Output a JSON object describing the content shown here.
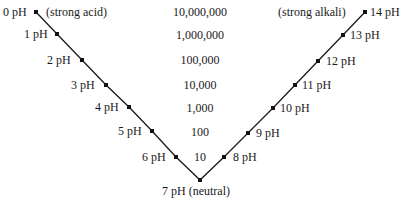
{
  "left_labels": [
    {
      "text": "0 pH",
      "x": 3,
      "y": 5
    },
    {
      "text": "1 pH",
      "x": 24,
      "y": 27
    },
    {
      "text": "2 pH",
      "x": 47,
      "y": 53
    },
    {
      "text": "3 pH",
      "x": 71,
      "y": 78
    },
    {
      "text": "4 pH",
      "x": 95,
      "y": 100
    },
    {
      "text": "5 pH",
      "x": 118,
      "y": 124
    },
    {
      "text": "6 pH",
      "x": 142,
      "y": 150
    }
  ],
  "acid_note": "(strong acid)",
  "alkali_note": "(strong alkali)",
  "neutral_label": "7 pH (neutral)",
  "right_labels": [
    {
      "text": "8 pH",
      "x": 233,
      "y": 150
    },
    {
      "text": "9 pH",
      "x": 256,
      "y": 126
    },
    {
      "text": "10 pH",
      "x": 280,
      "y": 101
    },
    {
      "text": "11 pH",
      "x": 302,
      "y": 78
    },
    {
      "text": "12 pH",
      "x": 326,
      "y": 54
    },
    {
      "text": "13 pH",
      "x": 350,
      "y": 28
    },
    {
      "text": "14 pH",
      "x": 370,
      "y": 5
    }
  ],
  "multipliers": [
    "10,000,000",
    "1,000,000",
    "100,000",
    "10,000",
    "1,000",
    "100",
    "10"
  ],
  "points": [
    [
      36,
      12
    ],
    [
      57,
      34
    ],
    [
      82,
      60
    ],
    [
      106,
      85
    ],
    [
      129,
      107
    ],
    [
      152,
      131
    ],
    [
      176,
      157
    ],
    [
      200,
      180
    ],
    [
      224,
      157
    ],
    [
      248,
      133
    ],
    [
      273,
      108
    ],
    [
      295,
      85
    ],
    [
      318,
      61
    ],
    [
      343,
      35
    ],
    [
      365,
      12
    ]
  ]
}
